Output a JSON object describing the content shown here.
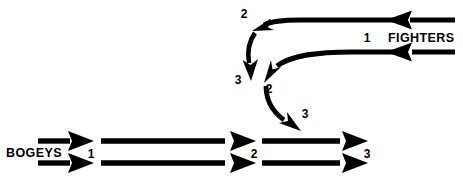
{
  "diagram": {
    "type": "tactical-flow",
    "background_color": "#ffffff",
    "line_color": "#000000",
    "forces": {
      "bogeys": {
        "label": "BOGEYS",
        "direction": "left-to-right",
        "track_count": 2,
        "phase_markers": [
          "1",
          "2",
          "3"
        ]
      },
      "fighters": {
        "label": "FIGHTERS",
        "direction": "right-to-left",
        "track_count": 2,
        "phase_markers": [
          "1",
          "2",
          "3"
        ]
      }
    },
    "markers": {
      "fighters_start": "1",
      "fighters_turn_upper": "2",
      "fighters_turn_lower": "3",
      "fighters_merge": "2",
      "fighters_attack": "3",
      "bogeys_start": "1",
      "bogeys_mid": "2",
      "bogeys_end": "3"
    }
  }
}
